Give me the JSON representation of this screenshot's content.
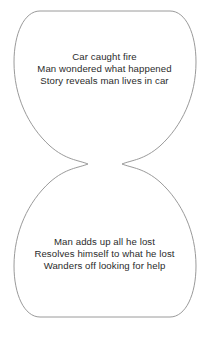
{
  "diagram": {
    "name": "hourglass-story-structure",
    "shape": "hourglass",
    "background_color": "#ffffff",
    "outline_color": "#9a9a9a",
    "outline_width": 1,
    "text_color": "#2b2b2b",
    "upper_chamber": {
      "label": "upper-chamber",
      "lines": [
        "Car caught fire",
        "Man wondered what happened",
        "Story reveals man lives in car"
      ]
    },
    "lower_chamber": {
      "label": "lower-chamber",
      "lines": [
        "Man adds up all he lost",
        "Resolves himself to what he lost",
        "Wanders off looking for help"
      ]
    }
  }
}
